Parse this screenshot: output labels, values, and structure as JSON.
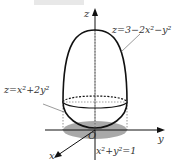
{
  "figure": {
    "axes": {
      "z": "z",
      "y": "y",
      "x": "x",
      "origin": "O"
    },
    "labels": {
      "upper_surface": "z=3−2x²−y²",
      "lower_surface": "z=x²+2y²",
      "projection": "x²+y²=1"
    },
    "colors": {
      "stroke": "#111111",
      "shadow": "#9a9a9a",
      "label": "#333333"
    }
  }
}
